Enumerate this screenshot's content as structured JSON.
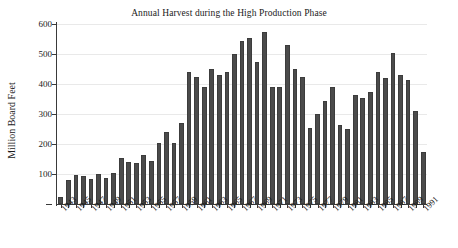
{
  "chart_data": {
    "type": "bar",
    "title": "Annual Harvest during the High Production Phase",
    "xlabel": "",
    "ylabel": "Million Board Feet",
    "ylim": [
      0,
      600
    ],
    "yticks": [
      0,
      100,
      200,
      300,
      400,
      500,
      600
    ],
    "ytick_labels": [
      "",
      "100",
      "200",
      "300",
      "400",
      "500",
      "600"
    ],
    "grid": true,
    "legend": "none",
    "bar_color": "#4b4b4b",
    "categories": [
      "1943",
      "1944",
      "1945",
      "1946",
      "1947",
      "1948",
      "1949",
      "1950",
      "1951",
      "1952",
      "1953",
      "1954",
      "1955",
      "1956",
      "1957",
      "1958",
      "1959",
      "1960",
      "1961",
      "1962",
      "1963",
      "1964",
      "1965",
      "1966",
      "1967",
      "1968",
      "1969",
      "1970",
      "1971",
      "1972",
      "1973",
      "1974",
      "1975",
      "1976",
      "1977",
      "1978",
      "1979",
      "1980",
      "1981",
      "1982",
      "1983",
      "1984",
      "1985",
      "1986",
      "1987",
      "1988",
      "1989",
      "1990",
      "1991"
    ],
    "xtick_labels_shown": [
      "1943",
      "1945",
      "1947",
      "1949",
      "1951",
      "1953",
      "1955",
      "1957",
      "1959",
      "1961",
      "1963",
      "1965",
      "1967",
      "1969",
      "1971",
      "1973",
      "1975",
      "1977",
      "1979",
      "1981",
      "1983",
      "1985",
      "1987",
      "1989",
      "1991"
    ],
    "values": [
      25,
      80,
      97,
      95,
      83,
      100,
      87,
      105,
      155,
      140,
      137,
      165,
      145,
      205,
      240,
      205,
      270,
      440,
      425,
      390,
      450,
      430,
      440,
      500,
      545,
      555,
      475,
      575,
      390,
      390,
      530,
      450,
      425,
      255,
      300,
      345,
      390,
      265,
      250,
      365,
      355,
      375,
      440,
      420,
      505,
      430,
      415,
      310,
      175
    ]
  }
}
